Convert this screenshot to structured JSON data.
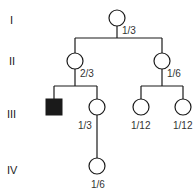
{
  "diagram": {
    "type": "pedigree",
    "generations": [
      {
        "label": "I"
      },
      {
        "label": "II"
      },
      {
        "label": "III"
      },
      {
        "label": "IV"
      }
    ],
    "individuals": [
      {
        "id": "I-1",
        "sex": "female",
        "affected": false,
        "probability": "1/3"
      },
      {
        "id": "II-1",
        "sex": "female",
        "affected": false,
        "probability": "2/3"
      },
      {
        "id": "II-2",
        "sex": "female",
        "affected": false,
        "probability": "1/6"
      },
      {
        "id": "III-1",
        "sex": "male",
        "affected": true,
        "probability": ""
      },
      {
        "id": "III-2",
        "sex": "female",
        "affected": false,
        "probability": "1/3"
      },
      {
        "id": "III-3",
        "sex": "female",
        "affected": false,
        "probability": "1/12"
      },
      {
        "id": "III-4",
        "sex": "female",
        "affected": false,
        "probability": "1/12"
      },
      {
        "id": "IV-1",
        "sex": "female",
        "affected": false,
        "probability": "1/6"
      }
    ],
    "colors": {
      "line": "#1a1a1a",
      "affected_fill": "#1a1a1a",
      "unaffected_fill": "#ffffff"
    }
  }
}
